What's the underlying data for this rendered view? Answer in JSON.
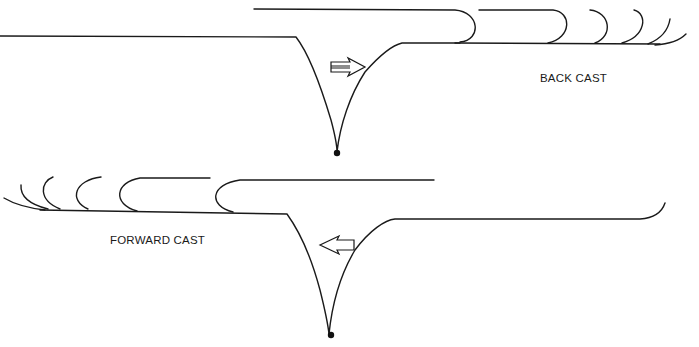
{
  "diagram": {
    "panels": [
      {
        "id": "back-cast",
        "label": "BACK CAST",
        "direction": "right",
        "arrow_icon": "right-hollow-arrow",
        "loop_stages": 6
      },
      {
        "id": "forward-cast",
        "label": "FORWARD CAST",
        "direction": "left",
        "arrow_icon": "left-hollow-arrow",
        "loop_stages": 6
      }
    ],
    "colors": {
      "ink": "#1a1a1a",
      "background": "#ffffff"
    }
  }
}
